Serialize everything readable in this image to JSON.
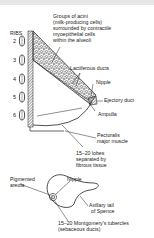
{
  "diagram": {
    "ribs_label": "RIBS",
    "rib_numbers": [
      "2",
      "3",
      "4",
      "5",
      "6"
    ],
    "labels": {
      "acini_line1": "Groups of acini",
      "acini_line2": "(milk-producing cells)",
      "acini_line3": "surrounded by contractile",
      "acini_line4": "myoepithelial cells",
      "acini_line5": "within the alveoli",
      "lactiferous": "Lactiferous ducts",
      "nipple_side": "Nipple",
      "ejectory": "Ejectory duct",
      "ampulla": "Ampulla",
      "pectoralis_line1": "Pectoralis",
      "pectoralis_line2": "major muscle",
      "lobes_line1": "15–20 lobes",
      "lobes_line2": "separated by",
      "lobes_line3": "fibrous tissue",
      "areola_line1": "Pigmented",
      "areola_line2": "areola",
      "nipple_front": "Nipple",
      "axillary_line1": "Axillary tail",
      "axillary_line2": "of Spence",
      "montgomery_line1": "15–20 Montgomery's tubercles",
      "montgomery_line2": "(sebaceous ducts)"
    },
    "colors": {
      "ink": "#1a1a1a",
      "band": "#e6e6e6",
      "background": "#ffffff"
    }
  }
}
